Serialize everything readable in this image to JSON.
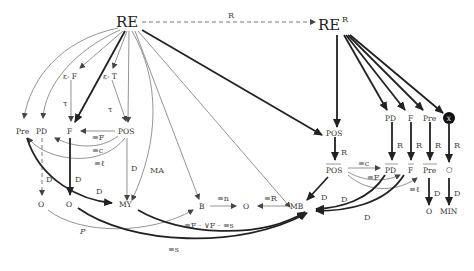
{
  "diagram": {
    "nodes": {
      "re": "RE",
      "re_r": "RE",
      "re_r_sup": "R",
      "eps_f": "ε- F",
      "eps_t": "ε- T",
      "pre": "Pre",
      "pd": "PD",
      "f": "F",
      "pos": "POS",
      "o1": "O",
      "o2": "O",
      "my": "MY",
      "b": "B",
      "o3": "O",
      "mb": "MB",
      "pos_r": "POS",
      "pos_bar": "POS",
      "pd_r": "PD",
      "f_r": "F",
      "pre_r": "Pre",
      "x_r": "X",
      "pd_bar": "PD",
      "f_bar": "F",
      "pre_bar": "Pre",
      "o_small": "○",
      "o_r": "O",
      "min": "MIN"
    },
    "edge_labels": {
      "re_to_rer": "R",
      "epsf_f": "τ",
      "epst_pos": "τ",
      "pos_f": "≡F",
      "pos_pd": "≡c",
      "pos_pre": "≡ℓ",
      "pd_o": "D",
      "f_o": "D",
      "pre_my": "D",
      "pos_my": "D",
      "re_my": "MA",
      "o_b": "P",
      "o_mb": "≡s",
      "my_mb": "≡F · ∨F · ≡s",
      "b_o": "≡n",
      "mb_o": "≡R",
      "posr_posbar": "R",
      "pdr_pdbar": "R",
      "fr_fbar": "R",
      "prer_prebar": "R",
      "xr_o": "R",
      "posbar_pdbar": "≡c",
      "posbar_fbar": "≡F",
      "posbar_prebar": "≡ℓ",
      "posbar_mb": "D",
      "pdbar_mb": "D",
      "fbar_mb": "D",
      "prebar_o": "D",
      "o_min": "D"
    }
  }
}
